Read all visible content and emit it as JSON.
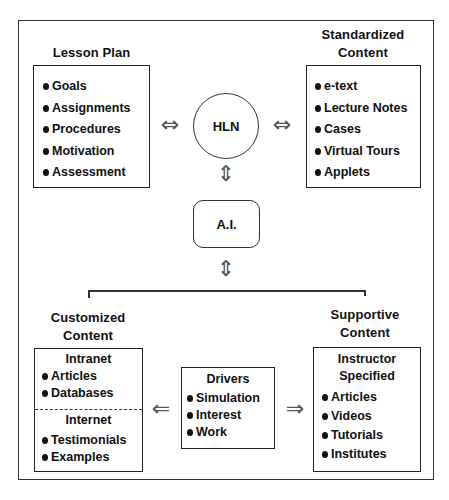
{
  "diagram": {
    "center": {
      "hub_label": "HLN",
      "ai_label": "A.I."
    },
    "lesson_plan": {
      "title": "Lesson Plan",
      "items": [
        "Goals",
        "Assignments",
        "Procedures",
        "Motivation",
        "Assessment"
      ]
    },
    "standardized_content": {
      "title_line1": "Standardized",
      "title_line2": "Content",
      "items": [
        "e-text",
        "Lecture Notes",
        "Cases",
        "Virtual Tours",
        "Applets"
      ]
    },
    "customized_content": {
      "title_line1": "Customized",
      "title_line2": "Content",
      "intranet": {
        "title": "Intranet",
        "items": [
          "Articles",
          "Databases"
        ]
      },
      "internet": {
        "title": "Internet",
        "items": [
          "Testimonials",
          "Examples"
        ]
      }
    },
    "drivers": {
      "title": "Drivers",
      "items": [
        "Simulation",
        "Interest",
        "Work"
      ]
    },
    "supportive_content": {
      "title_line1": "Supportive",
      "title_line2": "Content",
      "sub_title_line1": "Instructor",
      "sub_title_line2": "Specified",
      "items": [
        "Articles",
        "Videos",
        "Tutorials",
        "Institutes"
      ]
    },
    "arrows": {
      "bidirectional_horizontal": "⇔",
      "bidirectional_vertical": "⇕",
      "left": "⇐",
      "right": "⇒"
    }
  }
}
